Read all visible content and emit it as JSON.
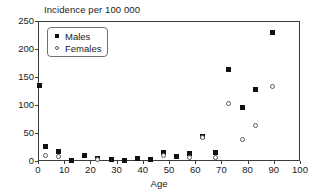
{
  "chart_data": {
    "type": "scatter",
    "title": "Incidence per 100 000",
    "xlabel": "Age",
    "ylabel": "",
    "xlim": [
      0,
      100
    ],
    "ylim": [
      0,
      250
    ],
    "xticks": [
      0,
      10,
      20,
      30,
      40,
      50,
      60,
      70,
      80,
      90,
      100
    ],
    "yticks": [
      0,
      50,
      100,
      150,
      200,
      250
    ],
    "grid": false,
    "legend_position": "top-left",
    "legend": [
      "Males",
      "Females"
    ],
    "x": [
      0,
      2.5,
      7.5,
      12.5,
      17.5,
      22.5,
      27.5,
      32.5,
      37.5,
      42.5,
      47.5,
      52.5,
      57.5,
      62.5,
      67.5,
      72.5,
      77.5,
      82.5,
      89
    ],
    "series": [
      {
        "name": "Males",
        "marker": "filled-square",
        "color": "#111111",
        "values": [
          136,
          27,
          19,
          3,
          11,
          6,
          5,
          2,
          7,
          4,
          17,
          10,
          16,
          46,
          17,
          166,
          97,
          130,
          232
        ]
      },
      {
        "name": "Females",
        "marker": "open-circle",
        "color": "#5a5a5a",
        "values": [
          null,
          11,
          10,
          null,
          null,
          4,
          null,
          null,
          null,
          null,
          11,
          null,
          8,
          44,
          8,
          105,
          41,
          65,
          134
        ]
      }
    ]
  },
  "axis": {
    "x_tick_labels": [
      "0",
      "10",
      "20",
      "30",
      "40",
      "50",
      "60",
      "70",
      "80",
      "90",
      "100"
    ],
    "y_tick_labels": [
      "0",
      "50",
      "100",
      "150",
      "200",
      "250"
    ]
  }
}
